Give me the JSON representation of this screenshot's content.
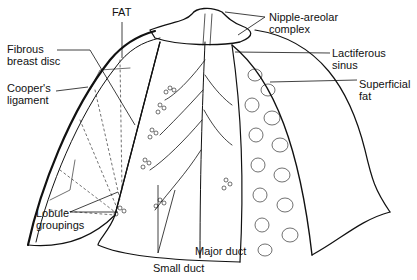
{
  "labels": {
    "fat": "FAT",
    "fibrous_breast_disc": [
      "Fibrous",
      "breast disc"
    ],
    "coopers_ligament": [
      "Cooper's",
      "ligament"
    ],
    "nipple_areolar_complex": [
      "Nipple-areolar",
      "complex"
    ],
    "lactiferous_sinus": [
      "Lactiferous",
      "sinus"
    ],
    "superficial_fat": [
      "Superficial",
      "fat"
    ],
    "lobule_groupings": [
      "Lobule",
      "groupings"
    ],
    "major_duct": "Major duct",
    "small_duct": "Small duct"
  }
}
